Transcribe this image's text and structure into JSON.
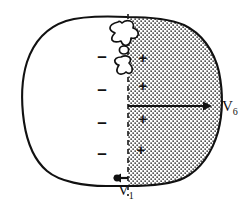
{
  "figure": {
    "type": "diagram",
    "canvas": {
      "width": 252,
      "height": 215
    },
    "background_color": "#ffffff",
    "line_color": "#111111",
    "stipple_color": "#3a3a3a",
    "stipple_fill_color": "#ffffff"
  },
  "body_outline": {
    "name": "body-cross-section-outline",
    "description": "Rounded irregular closed contour representing a transverse body section",
    "stroke_width": 2.1
  },
  "divider": {
    "name": "vertical-dashed-divider",
    "orientation": "vertical",
    "style": "dashed",
    "x": 128,
    "y_top": 14,
    "y_bottom": 196
  },
  "shaded_region": {
    "name": "stippled-positive-region",
    "fill": "stipple",
    "side": "right",
    "description": "Right half of section filled with dotted stipple texture"
  },
  "inner_blob": {
    "name": "heart-blob-outline",
    "description": "Small irregular amoeboid outline straddling the divider near the top, containing a small open circle",
    "lobes": 2,
    "inner_circle": true
  },
  "axis_v6": {
    "name": "v6-lead-axis",
    "orientation": "horizontal",
    "x_start": 128,
    "x_end": 209,
    "y": 106,
    "arrowhead": "right",
    "label": "V",
    "subscript": "6"
  },
  "axis_v1": {
    "name": "v1-lead-axis",
    "orientation": "horizontal",
    "x_start": 128,
    "x_end": 116,
    "y": 178,
    "arrowhead": "left",
    "label": "V",
    "subscript": "1"
  },
  "charges": {
    "negative_label": "–",
    "positive_label": "+",
    "negative": [
      {
        "name": "minus-sign-1",
        "x": 101,
        "y": 55
      },
      {
        "name": "minus-sign-2",
        "x": 101,
        "y": 88
      },
      {
        "name": "minus-sign-3",
        "x": 101,
        "y": 121
      },
      {
        "name": "minus-sign-4",
        "x": 101,
        "y": 152
      }
    ],
    "positive": [
      {
        "name": "plus-sign-1",
        "x": 142,
        "y": 57
      },
      {
        "name": "plus-sign-2",
        "x": 142,
        "y": 85
      },
      {
        "name": "plus-sign-3",
        "x": 142,
        "y": 118
      },
      {
        "name": "plus-sign-4",
        "x": 140,
        "y": 149
      }
    ]
  },
  "labels": {
    "v6": {
      "text": "V",
      "sub": "6"
    },
    "v1": {
      "text": "V",
      "sub": "1"
    }
  }
}
